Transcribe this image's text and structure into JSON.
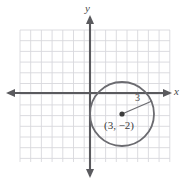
{
  "figure": {
    "type": "coordinate-plane-circle-diagram",
    "background_color": "#ffffff",
    "grid": {
      "color": "#d8d8dc",
      "x_start": 20,
      "y_start": 30,
      "x_end": 170,
      "y_end": 162,
      "cell_size": 10.7,
      "columns": 14,
      "rows": 12,
      "visible": true
    },
    "axes": {
      "color": "#5a5a5e",
      "origin_x": 90,
      "origin_y": 93,
      "x_axis": {
        "label": "x",
        "from_x": 8,
        "to_x": 170,
        "arrows": "both"
      },
      "y_axis": {
        "label": "y",
        "from_y": 17,
        "to_y": 176,
        "arrows": "both"
      },
      "tick_labels": []
    },
    "circle": {
      "color": "#6b6b70",
      "center_x_units": 3,
      "center_y_units": -2,
      "radius_units": 3,
      "center_px_x": 122,
      "center_px_y": 114,
      "radius_px": 32,
      "center_dot_color": "#3d3d3d",
      "center_label": "(3, −2)",
      "radius_label": "3",
      "radius_line": {
        "from_x": 122,
        "from_y": 114,
        "to_x": 152,
        "to_y": 101
      }
    }
  }
}
